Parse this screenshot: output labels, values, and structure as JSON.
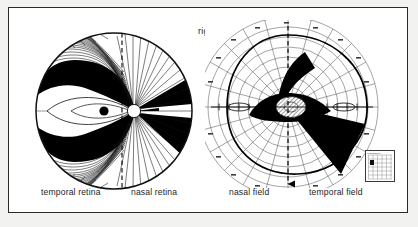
{
  "figure": {
    "title": "right eye",
    "background_color": "#ffffff",
    "border_color": "#2a2a2a",
    "ink_color": "#000000"
  },
  "retina_panel": {
    "name": "retinal nerve fiber map",
    "captions": {
      "left": "temporal retina",
      "right": "nasal retina"
    },
    "features": {
      "outline": "circle",
      "vertical_midline": "dashed",
      "horizontal_raphe": "solid",
      "optic_disc": "white filled circle",
      "fovea": "black filled dot",
      "temporal_fibers": "arcuate curved bundles",
      "nasal_fibers": "straight radial bundles",
      "shaded_sectors": "black wedges"
    }
  },
  "field_panel": {
    "name": "visual field perimetry chart",
    "captions": {
      "left": "nasal field",
      "right": "temporal field"
    },
    "features": {
      "grid": "polar isopter grid",
      "meridian_lines": 24,
      "eccentricity_circles": 9,
      "vertical_midline": "dashed with arrowhead",
      "horizontal_meridian": "solid with tick marks",
      "blind_spot": "black oval",
      "macula": "hatched ellipse",
      "defect_wedge": "black sector",
      "isopter_outline": "solid closed curve"
    },
    "legend": {
      "caption": "Target  Diameter",
      "side_label": "Luminance",
      "swatch": "filled square"
    }
  }
}
